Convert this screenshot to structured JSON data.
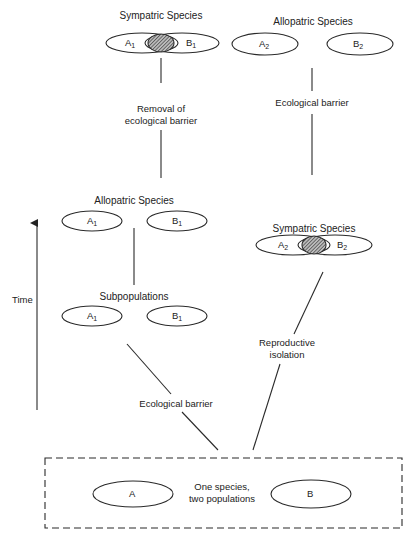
{
  "diagram": {
    "axis": {
      "label": "Time",
      "direction": "up"
    },
    "origin": {
      "caption": "One species, two populations",
      "caption_line1": "One species,",
      "caption_line2": "two populations",
      "populations": [
        "A",
        "B"
      ]
    },
    "left_path": {
      "edge_from_origin": "Ecological barrier",
      "subpopulations": {
        "label": "Subpopulations",
        "items": [
          "A",
          "B"
        ],
        "subscript": "1"
      },
      "allopatric": {
        "label": "Allopatric Species",
        "items": [
          "A",
          "B"
        ],
        "subscript": "1"
      },
      "edge_to_sympatric_line1": "Removal of",
      "edge_to_sympatric_line2": "ecological barrier",
      "sympatric": {
        "label": "Sympatric Species",
        "items": [
          "A",
          "B"
        ],
        "subscript": "1",
        "overlap": "hatched"
      }
    },
    "right_path": {
      "edge_from_origin_line1": "Reproductive",
      "edge_from_origin_line2": "isolation",
      "sympatric": {
        "label": "Sympatric Species",
        "items": [
          "A",
          "B"
        ],
        "subscript": "2",
        "overlap": "hatched"
      },
      "edge_to_allopatric": "Ecological barrier",
      "allopatric": {
        "label": "Allopatric Species",
        "items": [
          "A",
          "B"
        ],
        "subscript": "2"
      }
    }
  }
}
